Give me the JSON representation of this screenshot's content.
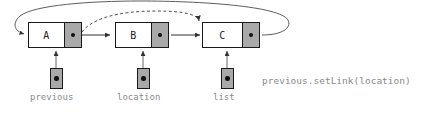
{
  "diagram": {
    "colors": {
      "node_fill": "#ffffff",
      "link_cell_fill": "#a9a9a9",
      "stroke": "#1a1a1a",
      "label_text": "#8a8a8a",
      "arrow": "#333333"
    },
    "nodes": [
      {
        "label": "A"
      },
      {
        "label": "B"
      },
      {
        "label": "C"
      }
    ],
    "pointers": [
      {
        "label": "previous"
      },
      {
        "label": "location"
      },
      {
        "label": "list"
      }
    ],
    "annotation": "previous.setLink(location)",
    "edges": [
      {
        "from": "A",
        "to": "B",
        "style": "solid"
      },
      {
        "from": "B",
        "to": "C",
        "style": "solid"
      },
      {
        "from": "C",
        "to": "A",
        "style": "solid-arc"
      },
      {
        "from": "A",
        "to": "C",
        "style": "dashed-arc"
      }
    ]
  }
}
